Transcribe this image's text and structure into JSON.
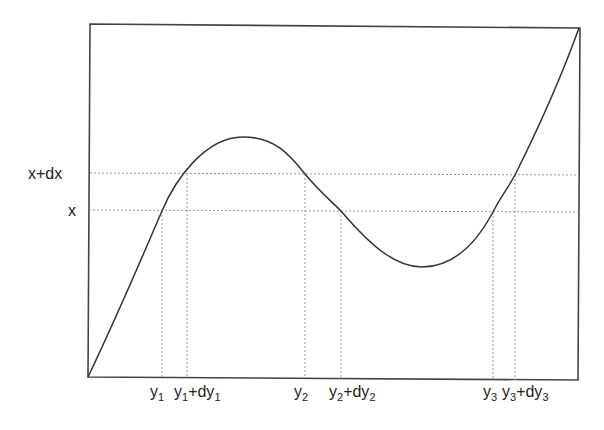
{
  "diagram": {
    "type": "function-inverse-illustration",
    "horizontal_levels": [
      {
        "label": "x+dx",
        "y": 174
      },
      {
        "label": "x",
        "y": 211
      }
    ],
    "vertical_markers": [
      {
        "base": "y",
        "sub": "1",
        "suffix": "",
        "suffix_sub": "",
        "x": 162
      },
      {
        "base": "y",
        "sub": "1",
        "suffix": "+dy",
        "suffix_sub": "1",
        "x": 187
      },
      {
        "base": "y",
        "sub": "2",
        "suffix": "",
        "suffix_sub": "",
        "x": 305
      },
      {
        "base": "y",
        "sub": "2",
        "suffix": "+dy",
        "suffix_sub": "2",
        "x": 341
      },
      {
        "base": "y",
        "sub": "3",
        "suffix": "",
        "suffix_sub": "",
        "x": 493
      },
      {
        "base": "y",
        "sub": "3",
        "suffix": "+dy",
        "suffix_sub": "3",
        "x": 515
      }
    ],
    "labels": {
      "x_plus_dx": "x+dx",
      "x": "x",
      "y1": "y",
      "y1_sub": "1",
      "y1dy1": "y",
      "y1dy1_sub": "1",
      "y1dy1_plus": "+dy",
      "y1dy1_plus_sub": "1",
      "y2": "y",
      "y2_sub": "2",
      "y2dy2": "y",
      "y2dy2_sub": "2",
      "y2dy2_plus": "+dy",
      "y2dy2_plus_sub": "2",
      "y3": "y",
      "y3_sub": "3",
      "y3dy3": "y",
      "y3dy3_sub": "3",
      "y3dy3_plus": "+dy",
      "y3dy3_plus_sub": "3"
    },
    "curve_key_points": {
      "start": [
        88,
        377
      ],
      "local_max": [
        243,
        137
      ],
      "local_min": [
        422,
        267
      ],
      "end": [
        579,
        28
      ]
    },
    "colors": {
      "frame": "#444444",
      "curve": "#333333",
      "guides": "#999999",
      "text": "#222222"
    }
  }
}
